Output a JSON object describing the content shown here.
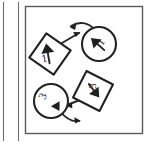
{
  "figure": {
    "medium": "scanned line drawing",
    "background_color": "#ffffff",
    "ink_color": "#232323",
    "frame": {
      "left_rule_label": "page-edge-rule",
      "panel_label": "diagram-panel-border",
      "panel_border_color": "#5a5a5a"
    },
    "nodes": [
      {
        "id": "node-1",
        "shape": "diamond",
        "position": "upper-left",
        "number": "1",
        "inner_arrow": "arrow-up",
        "cx": 50,
        "cy": 54,
        "r": 21,
        "rotation": -10
      },
      {
        "id": "node-2",
        "shape": "circle",
        "position": "upper-right",
        "number": "1",
        "inner_arrow": "arrow-up-left",
        "cx": 99,
        "cy": 44,
        "r": 17,
        "rotation": -55
      },
      {
        "id": "node-3",
        "shape": "diamond",
        "position": "lower-right",
        "number": "3",
        "inner_arrow": "arrow-down-left",
        "cx": 93,
        "cy": 91,
        "r": 21,
        "rotation": -35
      },
      {
        "id": "node-4",
        "shape": "circle",
        "position": "lower-left",
        "number": "3",
        "inner_arrow": "arrow-down-right",
        "cx": 51,
        "cy": 101,
        "r": 17,
        "rotation": -60
      }
    ],
    "connectors": [
      {
        "id": "connector-a",
        "from": "node-1",
        "to": "upper-space",
        "style": "straight-short",
        "direction": "up-right",
        "arrowhead": "end"
      },
      {
        "id": "connector-b",
        "from": "node-2",
        "to": "upper-space",
        "style": "curved",
        "direction": "left-up",
        "arrowhead": "end"
      },
      {
        "id": "connector-c",
        "from": "node-3",
        "to": "node-4",
        "style": "straight-short",
        "direction": "left-down",
        "arrowhead": "end"
      },
      {
        "id": "connector-d",
        "from": "node-4",
        "to": "lower-space",
        "style": "curved",
        "direction": "right-down",
        "arrowhead": "end"
      }
    ]
  }
}
